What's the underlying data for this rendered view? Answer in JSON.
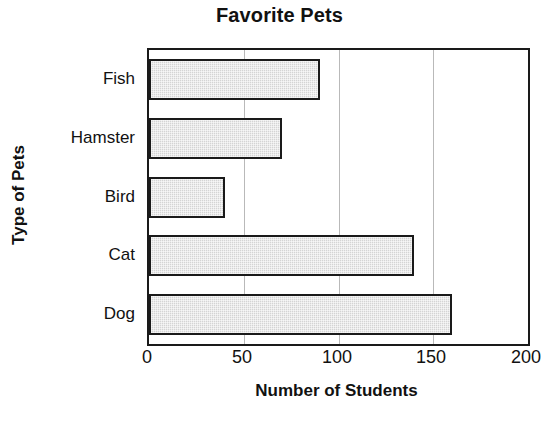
{
  "chart_data": {
    "type": "bar",
    "orientation": "horizontal",
    "title": "Favorite Pets",
    "xlabel": "Number of Students",
    "ylabel": "Type of Pets",
    "categories": [
      "Fish",
      "Hamster",
      "Bird",
      "Cat",
      "Dog"
    ],
    "values": [
      90,
      70,
      40,
      140,
      160
    ],
    "xlim": [
      0,
      200
    ],
    "xticks": [
      0,
      50,
      100,
      150,
      200
    ],
    "xtick_labels": [
      "0",
      "50",
      "100",
      "150",
      "200"
    ],
    "gridlines": [
      50,
      100,
      150
    ],
    "grid": true,
    "legend": false,
    "legend_position": "none",
    "bar_fill_color": "#d4d4d4",
    "bar_edge_color": "#1a1a1a",
    "axis_color": "#1a1a1a",
    "grid_color": "#b9b9b9",
    "background_color": "#ffffff",
    "category_order": "top-to-bottom"
  }
}
